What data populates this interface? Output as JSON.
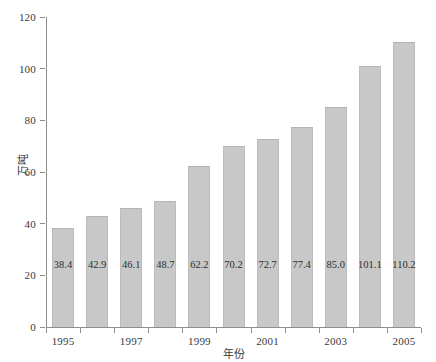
{
  "chart_data": {
    "type": "bar",
    "title": "",
    "subtitle": "",
    "xlabel": "年份",
    "ylabel": "万吨",
    "categories": [
      "1995",
      "1996",
      "1997",
      "1998",
      "1999",
      "2000",
      "2001",
      "2002",
      "2003",
      "2004",
      "2005"
    ],
    "values": [
      38.4,
      42.9,
      46.1,
      48.7,
      62.2,
      70.2,
      72.7,
      77.4,
      85.0,
      101.1,
      110.2
    ],
    "data_labels": [
      "38.4",
      "42.9",
      "46.1",
      "48.7",
      "62.2",
      "70.2",
      "72.7",
      "77.4",
      "85.0",
      "101.1",
      "110.2"
    ],
    "ylim": [
      0,
      120
    ],
    "yticks": [
      0,
      20,
      40,
      60,
      80,
      100,
      120
    ],
    "ytick_labels": [
      "0",
      "20",
      "40",
      "60",
      "80",
      "100",
      "120"
    ],
    "xtick_labels": [
      "1995",
      "1997",
      "1999",
      "2001",
      "2003",
      "2005"
    ],
    "xtick_categories": [
      "1995",
      "1997",
      "1999",
      "2001",
      "2003",
      "2005"
    ],
    "grid": false,
    "legend": false,
    "legend_position": "none",
    "bar_color": "#c8c8c8",
    "bar_edge_color": "#b4b4b4",
    "axis_color": "#8d8d8d",
    "text_color": "#3a3a3a",
    "background_color": "#ffffff"
  }
}
